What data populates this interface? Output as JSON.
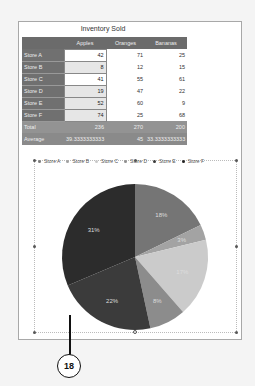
{
  "table": {
    "title": "Inventory Sold",
    "headers": [
      "",
      "Apples",
      "Oranges",
      "Bananas"
    ],
    "rows": [
      {
        "label": "Store A",
        "values": [
          "42",
          "71",
          "25"
        ]
      },
      {
        "label": "Store B",
        "values": [
          "8",
          "12",
          "15"
        ]
      },
      {
        "label": "Store C",
        "values": [
          "41",
          "55",
          "61"
        ]
      },
      {
        "label": "Store D",
        "values": [
          "19",
          "47",
          "22"
        ]
      },
      {
        "label": "Store E",
        "values": [
          "52",
          "60",
          "9"
        ]
      },
      {
        "label": "Store F",
        "values": [
          "74",
          "25",
          "68"
        ]
      }
    ],
    "total": {
      "label": "Total",
      "values": [
        "236",
        "270",
        "200"
      ]
    },
    "average": {
      "label": "Average",
      "values": [
        "39.3333333333",
        "45",
        "33.3333333333"
      ]
    }
  },
  "chart": {
    "legend": [
      {
        "label": "Store A",
        "color": "#7a7a7a"
      },
      {
        "label": "Store B",
        "color": "#a0a0a0"
      },
      {
        "label": "Store C",
        "color": "#c8c8c8"
      },
      {
        "label": "Store D",
        "color": "#8e8e8e"
      },
      {
        "label": "Store E",
        "color": "#3a3a3a"
      },
      {
        "label": "Store F",
        "color": "#2a2a2a"
      }
    ],
    "slice_labels": [
      "18%",
      "3%",
      "17%",
      "8%",
      "22%",
      "31%"
    ]
  },
  "chart_data": {
    "type": "pie",
    "title": "",
    "categories": [
      "Store A",
      "Store B",
      "Store C",
      "Store D",
      "Store E",
      "Store F"
    ],
    "values": [
      42,
      8,
      41,
      19,
      52,
      74
    ],
    "percent_labels": [
      "18%",
      "3%",
      "17%",
      "8%",
      "22%",
      "31%"
    ],
    "series_name": "Apples",
    "legend_position": "top"
  },
  "callout": {
    "number": "18"
  }
}
